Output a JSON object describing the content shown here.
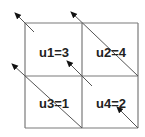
{
  "diagram": {
    "type": "grid-2x2-with-arrows",
    "colors": {
      "grid_line": "#7a7a7a",
      "arrow": "#555555",
      "arrow_head": "#111111",
      "text": "#222222",
      "background": "#ffffff"
    },
    "grid": {
      "left": 25,
      "top": 23,
      "right": 138,
      "bottom": 128,
      "mid_x": 82,
      "mid_y": 76
    },
    "cells": [
      {
        "id": "u1",
        "label": "u1=3",
        "x": 54,
        "y": 54
      },
      {
        "id": "u2",
        "label": "u2=4",
        "x": 111,
        "y": 54
      },
      {
        "id": "u3",
        "label": "u3=1",
        "x": 54,
        "y": 105
      },
      {
        "id": "u4",
        "label": "u4=2",
        "x": 111,
        "y": 105
      }
    ],
    "arrows": [
      {
        "id": "arrow-top-left-corner",
        "from": [
          34,
          32
        ],
        "to": [
          15,
          13
        ]
      },
      {
        "id": "arrow-through-u2",
        "from": [
          138,
          76
        ],
        "to": [
          71,
          12
        ]
      },
      {
        "id": "arrow-into-u1",
        "from": [
          92,
          86
        ],
        "to": [
          67,
          61
        ]
      },
      {
        "id": "arrow-through-u3",
        "from": [
          82,
          128
        ],
        "to": [
          12,
          64
        ]
      },
      {
        "id": "arrow-into-u4",
        "from": [
          138,
          128
        ],
        "to": [
          117,
          107
        ]
      }
    ]
  }
}
